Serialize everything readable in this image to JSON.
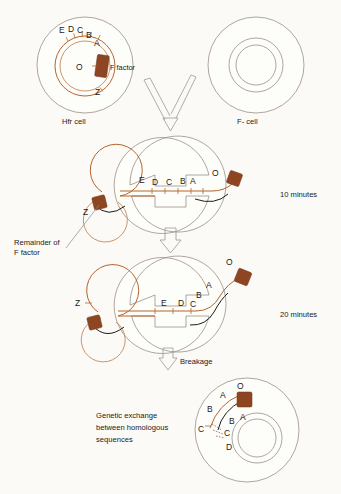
{
  "figure": {
    "colors": {
      "f_factor": "#8e4522",
      "chromosome": "#b5642f",
      "cell_membrane": "#9a8f86",
      "recipient_dna": "#1c1c1c",
      "background": "#fbfaf6"
    }
  },
  "stage1": {
    "hfr_label": "Hfr cell",
    "recipient_label": "F- cell",
    "f_factor_label": "F factor",
    "origin_label": "O",
    "genes": [
      "E",
      "D",
      "C",
      "B",
      "A"
    ],
    "terminal_gene": "Z"
  },
  "stage2": {
    "time_label": "10 minutes",
    "transferred_genes": [
      "E",
      "D",
      "C",
      "B",
      "A"
    ],
    "origin_label": "O",
    "terminal_gene": "Z",
    "remainder_label_line1": "Remainder of",
    "remainder_label_line2": "F factor"
  },
  "stage3": {
    "time_label": "20 minutes",
    "bridge_genes": [
      "E",
      "D"
    ],
    "transferred_genes": [
      "C",
      "B",
      "A"
    ],
    "origin_label": "O",
    "terminal_gene": "Z",
    "breakage_label": "Breakage"
  },
  "stage4": {
    "caption_line1": "Genetic exchange",
    "caption_line2": "between homologous",
    "caption_line3": "sequences",
    "donor_fragment_genes": [
      "O",
      "A",
      "B",
      "C"
    ],
    "recipient_genes": [
      "A",
      "B",
      "C",
      "D"
    ]
  }
}
